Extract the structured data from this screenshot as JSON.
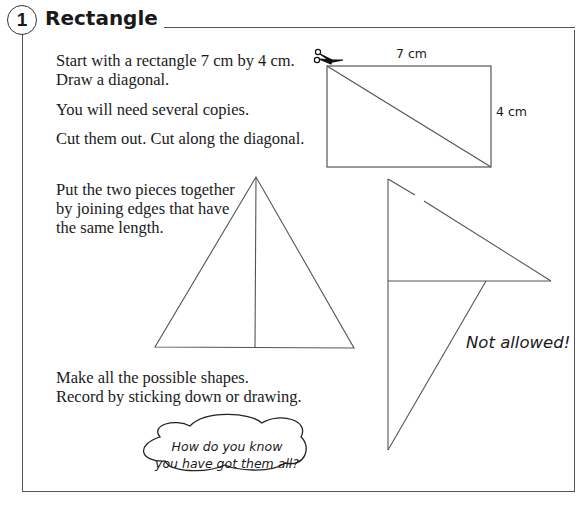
{
  "section": {
    "number": "1",
    "title": "Rectangle"
  },
  "instructions": {
    "line1": "Start with a rectangle 7 cm by 4 cm.",
    "line2": "Draw a diagonal.",
    "line3": "You will need several copies.",
    "line4": "Cut them out. Cut along the diagonal.",
    "line5": "Put the two pieces together",
    "line6": "by joining edges that have",
    "line7": "the same length.",
    "line8": "Make all the possible shapes.",
    "line9": "Record by sticking down or drawing."
  },
  "diagram": {
    "width_label": "7 cm",
    "height_label": "4 cm",
    "icon": "scissors-icon"
  },
  "example": {
    "not_allowed_label": "Not allowed!"
  },
  "thought_bubble": {
    "line1": "How do you know",
    "line2": "you have got them all?"
  }
}
